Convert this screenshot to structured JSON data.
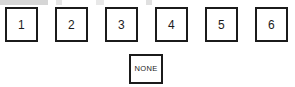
{
  "diagram": {
    "type": "selection-boxes",
    "background_color": "#ffffff",
    "border_color": "#1b1b1b",
    "text_color": "#1b1b1b",
    "option_row": [
      {
        "label": "1",
        "x": 5,
        "y": 7
      },
      {
        "label": "2",
        "x": 55,
        "y": 7
      },
      {
        "label": "3",
        "x": 105,
        "y": 7
      },
      {
        "label": "4",
        "x": 155,
        "y": 7
      },
      {
        "label": "5",
        "x": 205,
        "y": 7
      },
      {
        "label": "6",
        "x": 255,
        "y": 7
      }
    ],
    "none_option": {
      "label": "NONE",
      "x": 129,
      "y": 54
    }
  }
}
